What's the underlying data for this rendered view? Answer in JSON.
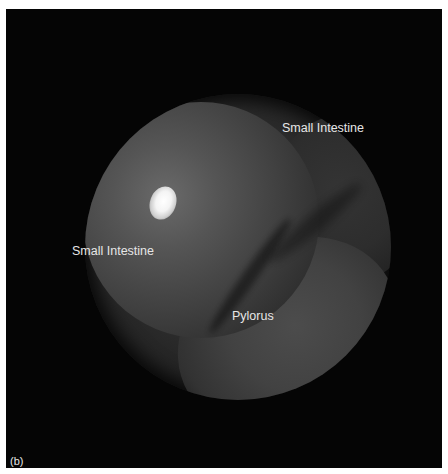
{
  "figure": {
    "panel_label": "(b)",
    "annotations": [
      {
        "text": "Small Intestine",
        "position": "upper-right"
      },
      {
        "text": "Small Intestine",
        "position": "left"
      },
      {
        "text": "Pylorus",
        "position": "lower-center"
      }
    ],
    "colors": {
      "background": "#050505",
      "label": "#e6e6e6",
      "border": "#ffffff"
    }
  }
}
